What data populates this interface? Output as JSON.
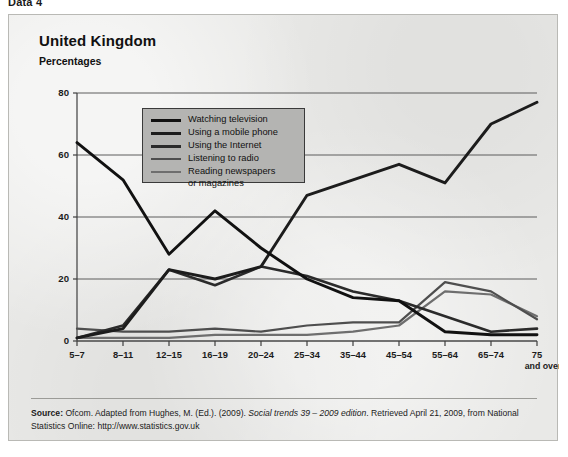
{
  "page": {
    "header_label": "Data 4"
  },
  "figure": {
    "title": "United Kingdom",
    "subtitle": "Percentages"
  },
  "legend": {
    "items": [
      {
        "label": "Watching television",
        "color": "#111111",
        "width": 3.0
      },
      {
        "label": "Using a mobile phone",
        "color": "#1c1c1c",
        "width": 3.0
      },
      {
        "label": "Using the Internet",
        "color": "#2b2b2b",
        "width": 2.6
      },
      {
        "label": "Listening to radio",
        "color": "#4e4e4e",
        "width": 2.2
      },
      {
        "label": "Reading newspapers\nor magazines",
        "color": "#6e6e6e",
        "width": 2.2
      }
    ]
  },
  "source": {
    "label": "Source:",
    "text_before_italic": " Ofcom. Adapted from Hughes, M. (Ed.). (2009). ",
    "italic_text": "Social trends 39 – 2009 edition",
    "text_after_italic": ". Retrieved April 21, 2009, from National Statistics Online: http://www.statistics.gov.uk"
  },
  "chart_data": {
    "type": "line",
    "title": "United Kingdom",
    "subtitle": "Percentages",
    "xlabel": "",
    "ylabel": "Percentages",
    "ylim": [
      0,
      80
    ],
    "yticks": [
      0,
      20,
      40,
      60,
      80
    ],
    "grid": true,
    "legend_position": "inside-upper-left",
    "categories": [
      "5–7",
      "8–11",
      "12–15",
      "16–19",
      "20–24",
      "25–34",
      "35–44",
      "45–54",
      "55–64",
      "65–74",
      "75"
    ],
    "category_sublabels": [
      "",
      "",
      "",
      "",
      "",
      "",
      "",
      "",
      "",
      "",
      "and over"
    ],
    "series": [
      {
        "name": "Watching television",
        "color": "#111111",
        "values": [
          64,
          52,
          28,
          42,
          30,
          20,
          14,
          13,
          3,
          2,
          2
        ]
      },
      {
        "name": "Using a mobile phone",
        "color": "#1c1c1c",
        "values": [
          1,
          4,
          23,
          20,
          24,
          47,
          52,
          57,
          51,
          70,
          77
        ]
      },
      {
        "name": "Using the Internet",
        "color": "#2b2b2b",
        "values": [
          1,
          5,
          23,
          18,
          24,
          21,
          16,
          13,
          8,
          3,
          4
        ]
      },
      {
        "name": "Listening to radio",
        "color": "#4e4e4e",
        "values": [
          4,
          3,
          3,
          4,
          3,
          5,
          6,
          6,
          19,
          16,
          7
        ]
      },
      {
        "name": "Reading newspapers or magazines",
        "color": "#6e6e6e",
        "values": [
          1,
          1,
          1,
          2,
          2,
          2,
          3,
          5,
          16,
          15,
          8
        ]
      }
    ]
  }
}
